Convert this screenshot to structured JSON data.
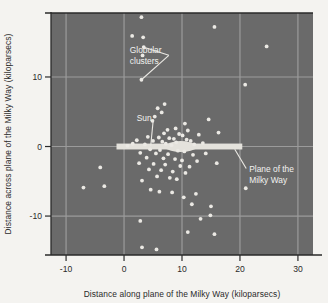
{
  "figure": {
    "plot_bg_color": "#6a6a6a",
    "grid_color": "#9b9b9b",
    "point_color": "#ebe9e4",
    "disk_color": "#e4e2dc",
    "axis_color": "#2a2a2a",
    "page_bg_color": "#f4f3f0"
  },
  "chart_data": {
    "type": "scatter",
    "title": "",
    "xlabel": "Distance along plane of the Milky Way (kiloparsecs)",
    "ylabel": "Distance across plane of the Milky Way (kiloparsecs)",
    "xlim": [
      -12.6,
      32.6
    ],
    "ylim": [
      -15.6,
      19.2
    ],
    "xticks": [
      -10,
      0,
      10,
      20,
      30
    ],
    "xticklabels": [
      "-10",
      "0",
      "10",
      "20",
      "30"
    ],
    "yticks": [
      10,
      0,
      -10
    ],
    "yticklabels": [
      "10",
      "0",
      "-10"
    ],
    "grid": true,
    "gridlines_x": [
      -10,
      0,
      10,
      20,
      30
    ],
    "gridlines_y": [
      10,
      0,
      -10
    ],
    "legend": null,
    "series": [
      {
        "name": "Globular clusters",
        "marker": "circle",
        "points": [
          [
            3.0,
            18.6
          ],
          [
            1.4,
            15.9
          ],
          [
            3.3,
            15.7
          ],
          [
            15.6,
            17.2
          ],
          [
            3.4,
            14.3
          ],
          [
            24.6,
            14.4
          ],
          [
            3.2,
            13.1
          ],
          [
            3.0,
            9.6
          ],
          [
            20.9,
            8.9
          ],
          [
            7.0,
            6.1
          ],
          [
            5.8,
            5.5
          ],
          [
            6.5,
            4.9
          ],
          [
            5.3,
            4.3
          ],
          [
            14.6,
            3.9
          ],
          [
            4.9,
            3.7
          ],
          [
            10.5,
            3.3
          ],
          [
            8.9,
            2.6
          ],
          [
            7.5,
            2.4
          ],
          [
            11.0,
            2.3
          ],
          [
            16.3,
            2.0
          ],
          [
            6.9,
            1.9
          ],
          [
            9.5,
            1.8
          ],
          [
            10.1,
            1.6
          ],
          [
            12.9,
            1.7
          ],
          [
            4.1,
            1.4
          ],
          [
            6.0,
            1.3
          ],
          [
            7.8,
            1.2
          ],
          [
            8.6,
            1.1
          ],
          [
            10.8,
            1.0
          ],
          [
            2.2,
            0.9
          ],
          [
            5.0,
            0.8
          ],
          [
            6.6,
            0.7
          ],
          [
            9.0,
            0.6
          ],
          [
            11.5,
            0.8
          ],
          [
            13.6,
            0.5
          ],
          [
            1.5,
            0.4
          ],
          [
            3.6,
            0.3
          ],
          [
            7.2,
            0.4
          ],
          [
            8.2,
            0.2
          ],
          [
            12.1,
            0.3
          ],
          [
            0.6,
            0.1
          ],
          [
            4.5,
            -0.4
          ],
          [
            6.2,
            -0.5
          ],
          [
            9.3,
            -0.6
          ],
          [
            10.4,
            -0.7
          ],
          [
            2.8,
            -0.9
          ],
          [
            5.5,
            -1.0
          ],
          [
            7.6,
            -1.1
          ],
          [
            11.9,
            -1.2
          ],
          [
            14.1,
            -1.0
          ],
          [
            3.9,
            -1.6
          ],
          [
            6.8,
            -1.7
          ],
          [
            8.8,
            -1.8
          ],
          [
            10.0,
            -2.0
          ],
          [
            12.6,
            -2.1
          ],
          [
            2.6,
            -2.4
          ],
          [
            5.1,
            -2.5
          ],
          [
            7.1,
            -2.6
          ],
          [
            9.7,
            -2.8
          ],
          [
            11.3,
            -2.9
          ],
          [
            16.0,
            -2.4
          ],
          [
            4.3,
            -3.3
          ],
          [
            6.4,
            -3.4
          ],
          [
            8.4,
            -3.6
          ],
          [
            10.6,
            -3.8
          ],
          [
            5.7,
            -4.3
          ],
          [
            7.9,
            -4.5
          ],
          [
            9.1,
            -4.7
          ],
          [
            3.1,
            -4.9
          ],
          [
            -7.0,
            -5.9
          ],
          [
            -3.4,
            -5.7
          ],
          [
            4.6,
            -6.2
          ],
          [
            6.1,
            -6.5
          ],
          [
            8.3,
            -6.6
          ],
          [
            21.0,
            -6.0
          ],
          [
            12.4,
            -6.8
          ],
          [
            10.3,
            -7.3
          ],
          [
            11.7,
            -8.3
          ],
          [
            15.0,
            -8.6
          ],
          [
            -4.1,
            -3.0
          ],
          [
            14.9,
            -9.9
          ],
          [
            13.2,
            -10.4
          ],
          [
            2.8,
            -10.7
          ],
          [
            11.0,
            -12.3
          ],
          [
            15.6,
            -12.6
          ],
          [
            3.1,
            -14.5
          ],
          [
            5.6,
            -14.8
          ]
        ]
      }
    ],
    "galaxy_disk": {
      "label": "Plane of the Milky Way",
      "x_start": -1.3,
      "x_end": 20.4,
      "thickness_kpc": 0.85,
      "bulge_center_x": 9.8,
      "bulge_half_width_kpc": 3.4,
      "bulge_half_height_kpc": 1.6
    },
    "annotations": [
      {
        "name": "globular-clusters",
        "text_lines": [
          "Globular",
          "clusters"
        ],
        "text_x": 1.0,
        "text_y": 13.4,
        "leader_targets": [
          [
            3.3,
            14.3
          ],
          [
            3.0,
            9.6
          ]
        ]
      },
      {
        "name": "sun",
        "text_lines": [
          "Sun"
        ],
        "text_x": 2.2,
        "text_y": 3.6,
        "leader_targets": [
          [
            4.6,
            0.1
          ]
        ]
      },
      {
        "name": "plane-of-the-milky-way",
        "text_lines": [
          "Plane of the",
          "Milky Way"
        ],
        "text_x": 21.6,
        "text_y": -3.6,
        "leader_targets": [
          [
            19.1,
            -0.4
          ]
        ]
      }
    ]
  }
}
